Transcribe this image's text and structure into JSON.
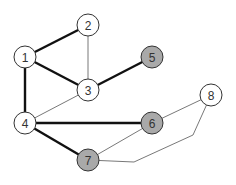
{
  "graph": {
    "colors": {
      "white": "#ffffff",
      "gray": "#a9a9a9",
      "edge_thin": "#555555",
      "edge_thick": "#111111"
    },
    "nodes": [
      {
        "id": "1",
        "label": "1",
        "x": 25,
        "y": 57,
        "fill": "white"
      },
      {
        "id": "2",
        "label": "2",
        "x": 88,
        "y": 25,
        "fill": "white"
      },
      {
        "id": "3",
        "label": "3",
        "x": 88,
        "y": 90,
        "fill": "white"
      },
      {
        "id": "4",
        "label": "4",
        "x": 25,
        "y": 123,
        "fill": "white"
      },
      {
        "id": "5",
        "label": "5",
        "x": 152,
        "y": 57,
        "fill": "gray"
      },
      {
        "id": "6",
        "label": "6",
        "x": 152,
        "y": 123,
        "fill": "gray"
      },
      {
        "id": "7",
        "label": "7",
        "x": 88,
        "y": 160,
        "fill": "gray"
      },
      {
        "id": "8",
        "label": "8",
        "x": 211,
        "y": 95,
        "fill": "white"
      }
    ],
    "edges": [
      {
        "from": "1",
        "to": "2",
        "weight": "thick"
      },
      {
        "from": "1",
        "to": "3",
        "weight": "thick"
      },
      {
        "from": "1",
        "to": "4",
        "weight": "thick"
      },
      {
        "from": "2",
        "to": "3",
        "weight": "thin"
      },
      {
        "from": "3",
        "to": "5",
        "weight": "thick"
      },
      {
        "from": "3",
        "to": "4",
        "weight": "thin"
      },
      {
        "from": "4",
        "to": "6",
        "weight": "thick"
      },
      {
        "from": "4",
        "to": "7",
        "weight": "thick"
      },
      {
        "from": "6",
        "to": "7",
        "weight": "thin"
      },
      {
        "from": "6",
        "to": "8",
        "weight": "thin"
      },
      {
        "from": "8",
        "to": "7",
        "weight": "thin",
        "bends": [
          [
            193,
            135
          ],
          [
            134,
            162
          ]
        ]
      }
    ]
  }
}
